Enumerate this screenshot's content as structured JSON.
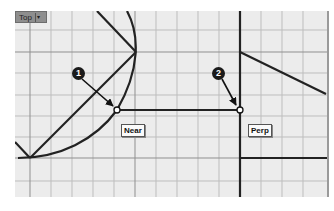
{
  "viewport": {
    "name": "Top",
    "dropdown_glyph": "▾",
    "grid": {
      "minor_spacing_px": 21,
      "grid_color": "#b8b8b8",
      "major_color": "#8a8a8a",
      "background": "#ececec"
    }
  },
  "snap_labels": [
    {
      "text": "Near"
    },
    {
      "text": "Perp"
    }
  ],
  "callouts": [
    {
      "number": "1"
    },
    {
      "number": "2"
    }
  ],
  "colors": {
    "geometry": "#222222",
    "callout_bg": "#1a1a1a"
  }
}
